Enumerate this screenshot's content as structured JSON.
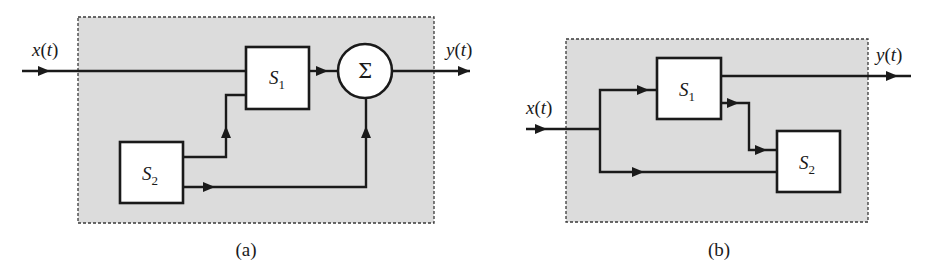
{
  "diagram_a": {
    "caption": "(a)",
    "input_label": "x(t)",
    "input_var": "x",
    "input_arg": "t",
    "output_label": "y(t)",
    "output_var": "y",
    "output_arg": "t",
    "blocks": [
      {
        "id": "S1",
        "letter": "S",
        "subscript": "1"
      },
      {
        "id": "S2",
        "letter": "S",
        "subscript": "2"
      }
    ],
    "summer": {
      "symbol": "Σ"
    },
    "connections": [
      "x(t) -> S1",
      "S2 -> S1",
      "S1 -> Σ",
      "S2 -> Σ",
      "Σ -> y(t)"
    ]
  },
  "diagram_b": {
    "caption": "(b)",
    "input_label": "x(t)",
    "input_var": "x",
    "input_arg": "t",
    "output_label": "y(t)",
    "output_var": "y",
    "output_arg": "t",
    "blocks": [
      {
        "id": "S1",
        "letter": "S",
        "subscript": "1"
      },
      {
        "id": "S2",
        "letter": "S",
        "subscript": "2"
      }
    ],
    "connections": [
      "x(t) -> S1",
      "x(t) -> S2",
      "S1 -> y(t)",
      "S1 -> S2"
    ]
  },
  "colors": {
    "frame_fill": "#dcdcdc",
    "frame_stroke": "#3a3a3a",
    "line": "#1a1a1a",
    "block_fill": "#ffffff"
  }
}
